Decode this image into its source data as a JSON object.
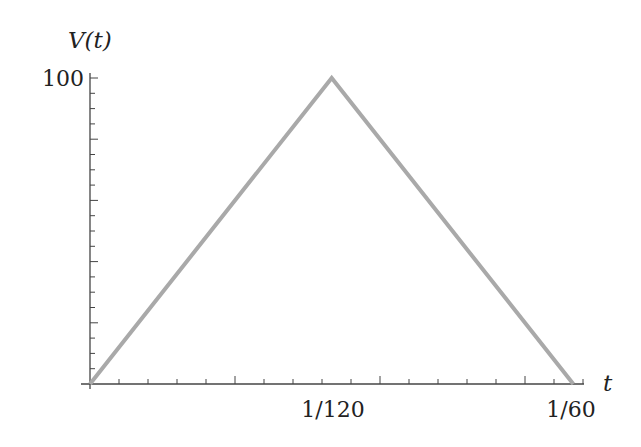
{
  "chart_data": {
    "type": "line",
    "title": "",
    "xlabel": "t",
    "ylabel": "V(t)",
    "x": [
      0,
      0.0083333,
      0.0166667
    ],
    "series": [
      {
        "name": "V(t)",
        "values": [
          0,
          100,
          0
        ],
        "color": "#a9a9a9"
      }
    ],
    "xlim": [
      0,
      0.0166667
    ],
    "ylim": [
      0,
      100
    ],
    "x_tick_labels": [
      {
        "value": 0.0083333,
        "label": "1/120"
      },
      {
        "value": 0.0166667,
        "label": "1/60"
      }
    ],
    "y_tick_labels": [
      {
        "value": 100,
        "label": "100"
      }
    ],
    "x_minor_tick_step": 0.001,
    "x_major_tick_step": 0.005,
    "y_minor_tick_step": 5,
    "y_major_tick_step": 20,
    "grid": false,
    "legend": "none"
  },
  "colors": {
    "line": "#a9a9a9",
    "axis": "#444444",
    "text": "#222222"
  }
}
